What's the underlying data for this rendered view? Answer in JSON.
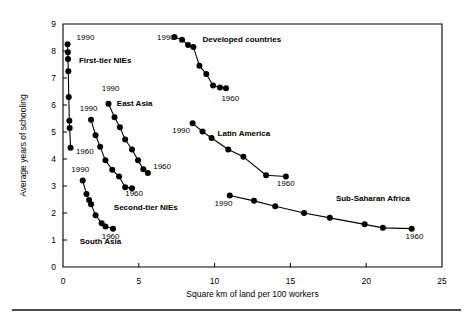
{
  "chart_data": {
    "type": "line",
    "title": "",
    "subtitle": "",
    "xlabel": "Square km of land per 100 workers",
    "ylabel": "Average years of schooling",
    "xlim": [
      0,
      25
    ],
    "ylim": [
      0,
      9
    ],
    "xticks": [
      0,
      5,
      10,
      15,
      20,
      25
    ],
    "yticks": [
      0,
      1,
      2,
      3,
      4,
      5,
      6,
      7,
      8,
      9
    ],
    "grid": false,
    "legend": "inline-annotations",
    "marker": "filled-circle",
    "endpoint_labels": [
      "1990",
      "1960"
    ],
    "series": [
      {
        "name": "First-tier NIEs",
        "label_x": 1.05,
        "label_y": 7.55,
        "start_label": "1990",
        "start_label_x": 0.9,
        "start_label_y": 8.42,
        "end_label": "1960",
        "end_label_x": 0.85,
        "end_label_y": 4.2,
        "points": [
          [
            0.3,
            8.25
          ],
          [
            0.32,
            7.95
          ],
          [
            0.33,
            7.7
          ],
          [
            0.35,
            7.25
          ],
          [
            0.38,
            6.3
          ],
          [
            0.42,
            5.42
          ],
          [
            0.44,
            5.15
          ],
          [
            0.5,
            4.42
          ]
        ]
      },
      {
        "name": "Second-tier NIEs",
        "label_x": 3.35,
        "label_y": 2.12,
        "start_label": "1990",
        "start_label_x": 1.1,
        "start_label_y": 5.78,
        "end_label": "1960",
        "end_label_x": 4.1,
        "end_label_y": 2.62,
        "points": [
          [
            1.85,
            5.45
          ],
          [
            2.15,
            4.88
          ],
          [
            2.45,
            4.45
          ],
          [
            2.8,
            3.95
          ],
          [
            3.25,
            3.6
          ],
          [
            3.7,
            3.35
          ],
          [
            4.1,
            2.95
          ],
          [
            4.55,
            2.92
          ]
        ]
      },
      {
        "name": "East Asia",
        "label_x": 3.55,
        "label_y": 5.95,
        "start_label": "1990",
        "start_label_x": 2.55,
        "start_label_y": 6.52,
        "end_label": "1960",
        "end_label_x": 5.95,
        "end_label_y": 3.62,
        "points": [
          [
            3.0,
            6.05
          ],
          [
            3.4,
            5.55
          ],
          [
            3.75,
            5.18
          ],
          [
            4.1,
            4.72
          ],
          [
            4.55,
            4.35
          ],
          [
            4.95,
            3.95
          ],
          [
            5.3,
            3.62
          ],
          [
            5.6,
            3.48
          ]
        ]
      },
      {
        "name": "South Asia",
        "label_x": 1.1,
        "label_y": 0.85,
        "start_label": "1990",
        "start_label_x": 0.55,
        "start_label_y": 3.52,
        "end_label": "1960",
        "end_label_x": 2.55,
        "end_label_y": 1.05,
        "points": [
          [
            1.3,
            3.2
          ],
          [
            1.55,
            2.7
          ],
          [
            1.72,
            2.48
          ],
          [
            1.85,
            2.32
          ],
          [
            2.15,
            1.92
          ],
          [
            2.55,
            1.62
          ],
          [
            2.8,
            1.5
          ],
          [
            3.3,
            1.42
          ]
        ]
      },
      {
        "name": "Developed countries",
        "label_x": 9.2,
        "label_y": 8.32,
        "start_label": "1990",
        "start_label_x": 6.2,
        "start_label_y": 8.42,
        "end_label": "1960",
        "end_label_x": 10.45,
        "end_label_y": 6.15,
        "points": [
          [
            7.35,
            8.52
          ],
          [
            7.85,
            8.42
          ],
          [
            8.25,
            8.22
          ],
          [
            8.6,
            8.15
          ],
          [
            9.0,
            7.45
          ],
          [
            9.45,
            7.15
          ],
          [
            9.9,
            6.72
          ],
          [
            10.35,
            6.65
          ],
          [
            10.75,
            6.62
          ]
        ]
      },
      {
        "name": "Latin America",
        "label_x": 10.2,
        "label_y": 4.85,
        "start_label": "1990",
        "start_label_x": 7.2,
        "start_label_y": 4.95,
        "end_label": "1960",
        "end_label_x": 14.1,
        "end_label_y": 3.02,
        "points": [
          [
            8.55,
            5.32
          ],
          [
            9.2,
            5.02
          ],
          [
            9.8,
            4.78
          ],
          [
            10.9,
            4.35
          ],
          [
            11.9,
            4.08
          ],
          [
            13.4,
            3.4
          ],
          [
            14.7,
            3.35
          ]
        ]
      },
      {
        "name": "Sub-Saharan Africa",
        "label_x": 18.0,
        "label_y": 2.45,
        "start_label": "1990",
        "start_label_x": 10.0,
        "start_label_y": 2.25,
        "end_label": "1960",
        "end_label_x": 22.6,
        "end_label_y": 1.05,
        "points": [
          [
            11.0,
            2.65
          ],
          [
            12.6,
            2.45
          ],
          [
            14.0,
            2.25
          ],
          [
            15.9,
            2.0
          ],
          [
            17.6,
            1.82
          ],
          [
            19.9,
            1.58
          ],
          [
            21.1,
            1.45
          ],
          [
            23.0,
            1.42
          ]
        ]
      }
    ]
  }
}
